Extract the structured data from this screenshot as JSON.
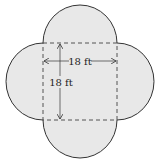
{
  "diagram": {
    "colors": {
      "fill": "#e8e8e8",
      "stroke": "#333333",
      "dashed": "#444444",
      "background": "#ffffff"
    },
    "square": {
      "side_label_horizontal": "18 ft",
      "side_label_vertical": "18 ft"
    },
    "labels": {
      "width": "18 ft",
      "height": "18 ft"
    }
  }
}
